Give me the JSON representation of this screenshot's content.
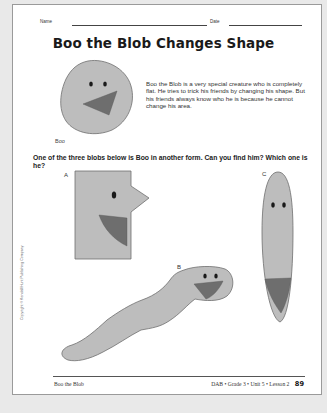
{
  "header": {
    "name_label": "Name",
    "date_label": "Date"
  },
  "title": "Boo the Blob Changes Shape",
  "intro": {
    "text": "Boo the Blob is a very special creature who is completely flat. He tries to trick his friends by changing his shape. But his friends always know who he is because he cannot change his area.",
    "caption": "Boo"
  },
  "question": "One of the three blobs below is Boo in another form. Can you find him? Which one is he?",
  "choices": [
    {
      "letter": "A",
      "shape": "rectangle-with-triangle"
    },
    {
      "letter": "B",
      "shape": "worm"
    },
    {
      "letter": "C",
      "shape": "tall-ellipse"
    }
  ],
  "copyright": "Copyright © Kendall/Hunt Publishing Company",
  "footer": {
    "left": "Boo the Blob",
    "right": "DAB • Grade 3 • Unit 5 • Lesson 2",
    "page_number": "89"
  },
  "colors": {
    "blob_fill": "#bdbdbd",
    "blob_stroke": "#6f6f6f",
    "mouth_fill": "#6e6e6e",
    "eye_fill": "#1a1a1a",
    "background": "#e9e9e9",
    "page": "#ffffff"
  }
}
